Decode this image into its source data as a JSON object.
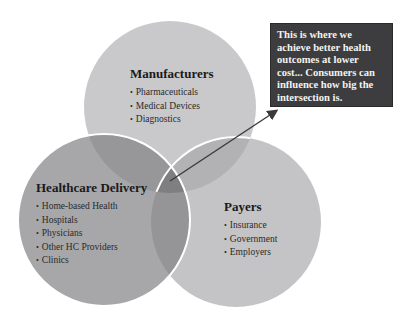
{
  "diagram": {
    "type": "venn",
    "circles": [
      {
        "id": "manufacturers",
        "title": "Manufacturers",
        "items": [
          "Pharmaceuticals",
          "Medical Devices",
          "Diagnostics"
        ],
        "color": "#c9c9cb"
      },
      {
        "id": "healthcare-delivery",
        "title": "Healthcare Delivery",
        "items": [
          "Home-based Health",
          "Hospitals",
          "Physicians",
          "Other HC Providers",
          "Clinics"
        ],
        "color": "#a7a7a9"
      },
      {
        "id": "payers",
        "title": "Payers",
        "items": [
          "Insurance",
          "Government",
          "Employers"
        ],
        "color": "#c4c4c6"
      }
    ],
    "callout": {
      "text": "This is where we achieve better health outcomes at lower cost... Consumers can influence how big the intersection is.",
      "background": "#3d3d3f",
      "points_to": "three-way intersection"
    }
  }
}
